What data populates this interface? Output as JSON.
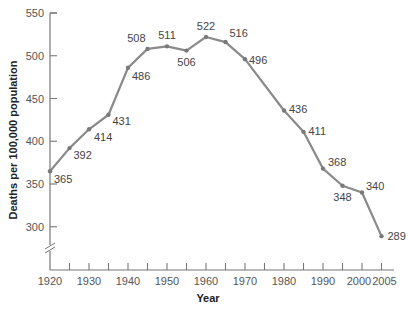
{
  "chart_data": {
    "type": "line",
    "title": "",
    "xlabel": "Year",
    "ylabel": "Deaths per 100,000 population",
    "x": [
      1920,
      1925,
      1930,
      1935,
      1940,
      1945,
      1950,
      1955,
      1960,
      1965,
      1970,
      1975,
      1980,
      1985,
      1990,
      1995,
      2000,
      2005
    ],
    "series": [
      {
        "name": "Deaths per 100,000 population",
        "values": [
          365,
          392,
          414,
          431,
          486,
          508,
          511,
          506,
          522,
          516,
          496,
          null,
          436,
          411,
          368,
          348,
          340,
          289
        ]
      }
    ],
    "points": [
      {
        "x": 1920,
        "y": 365,
        "label": "365"
      },
      {
        "x": 1925,
        "y": 392,
        "label": "392"
      },
      {
        "x": 1930,
        "y": 414,
        "label": "414"
      },
      {
        "x": 1935,
        "y": 431,
        "label": "431"
      },
      {
        "x": 1940,
        "y": 486,
        "label": "486"
      },
      {
        "x": 1945,
        "y": 508,
        "label": "508"
      },
      {
        "x": 1950,
        "y": 511,
        "label": "511"
      },
      {
        "x": 1955,
        "y": 506,
        "label": "506"
      },
      {
        "x": 1960,
        "y": 522,
        "label": "522"
      },
      {
        "x": 1965,
        "y": 516,
        "label": "516"
      },
      {
        "x": 1970,
        "y": 496,
        "label": "496"
      },
      {
        "x": 1980,
        "y": 436,
        "label": "436"
      },
      {
        "x": 1985,
        "y": 411,
        "label": "411"
      },
      {
        "x": 1990,
        "y": 368,
        "label": "368"
      },
      {
        "x": 1995,
        "y": 348,
        "label": "348"
      },
      {
        "x": 2000,
        "y": 340,
        "label": "340"
      },
      {
        "x": 2005,
        "y": 289,
        "label": "289"
      }
    ],
    "x_tick_labels": [
      "1920",
      "1930",
      "1940",
      "1950",
      "1960",
      "1970",
      "1980",
      "1990",
      "2000",
      "2005"
    ],
    "y_tick_labels": [
      "300",
      "350",
      "400",
      "450",
      "500",
      "550"
    ],
    "ylim": [
      270,
      550
    ],
    "xlim": [
      1920,
      2005
    ],
    "axis_break": "y-axis broken below 300",
    "grid": false,
    "legend": "none",
    "line_color": "#8a8a8a"
  }
}
